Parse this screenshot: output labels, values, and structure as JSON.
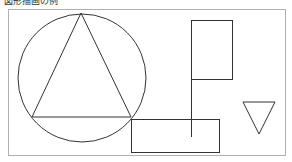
{
  "title": "図形描画の例",
  "colors": {
    "frame": "#b0b0b0",
    "stroke": "#333333",
    "background": "#ffffff"
  },
  "canvas": {
    "frame": {
      "x": 8,
      "y": 9,
      "width": 277,
      "height": 146
    },
    "circle": {
      "cx": 82,
      "cy": 78,
      "r": 64
    },
    "big_triangle": {
      "points": "81,13 32,117 131,117"
    },
    "tall_rect": {
      "x": 191,
      "y": 20,
      "width": 41,
      "height": 59
    },
    "vertical_line": {
      "x1": 191,
      "y1": 79,
      "x2": 191,
      "y2": 137
    },
    "wide_rect": {
      "x": 131,
      "y": 119,
      "width": 88,
      "height": 33
    },
    "small_triangle": {
      "points": "243,102 275,102 259,134"
    }
  }
}
